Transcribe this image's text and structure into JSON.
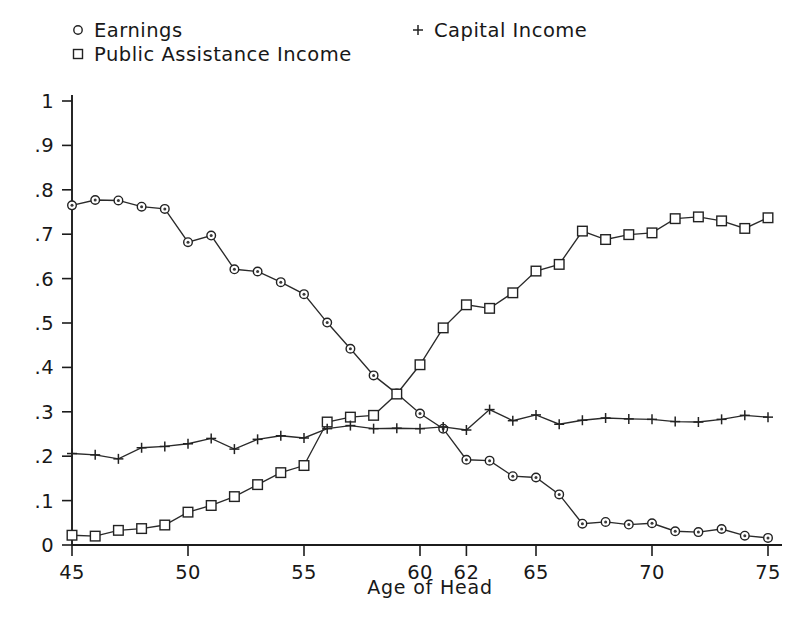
{
  "chart_data": {
    "type": "line",
    "title": "",
    "xlabel": "Age of Head",
    "ylabel": "",
    "xlim": [
      45,
      75
    ],
    "ylim": [
      0,
      1
    ],
    "grid": false,
    "legend_position": "top",
    "xticks": [
      45,
      50,
      55,
      60,
      62,
      65,
      70,
      75
    ],
    "xtick_labels": [
      "45",
      "50",
      "55",
      "60",
      "62",
      "65",
      "70",
      "75"
    ],
    "yticks": [
      0,
      0.1,
      0.2,
      0.3,
      0.4,
      0.5,
      0.6,
      0.7,
      0.8,
      0.9,
      1
    ],
    "ytick_labels": [
      "0",
      ".1",
      ".2",
      ".3",
      ".4",
      ".5",
      ".6",
      ".7",
      ".8",
      ".9",
      "1"
    ],
    "x": [
      45,
      46,
      47,
      48,
      49,
      50,
      51,
      52,
      53,
      54,
      55,
      56,
      57,
      58,
      59,
      60,
      61,
      62,
      63,
      64,
      65,
      66,
      67,
      68,
      69,
      70,
      71,
      72,
      73,
      74,
      75
    ],
    "series": [
      {
        "name": "Earnings",
        "marker": "circle",
        "values": [
          0.765,
          0.777,
          0.776,
          0.762,
          0.757,
          0.682,
          0.697,
          0.621,
          0.616,
          0.592,
          0.565,
          0.501,
          0.442,
          0.382,
          0.341,
          0.296,
          0.262,
          0.192,
          0.19,
          0.155,
          0.152,
          0.114,
          0.048,
          0.052,
          0.046,
          0.049,
          0.031,
          0.029,
          0.036,
          0.021,
          0.016
        ]
      },
      {
        "name": "Public Assistance Income",
        "marker": "square",
        "values": [
          0.022,
          0.02,
          0.033,
          0.037,
          0.045,
          0.074,
          0.089,
          0.109,
          0.136,
          0.163,
          0.179,
          0.277,
          0.288,
          0.292,
          0.34,
          0.406,
          0.489,
          0.541,
          0.533,
          0.568,
          0.617,
          0.632,
          0.707,
          0.688,
          0.699,
          0.703,
          0.735,
          0.739,
          0.73,
          0.713,
          0.737
        ]
      },
      {
        "name": "Capital Income",
        "marker": "plus",
        "values": [
          0.206,
          0.203,
          0.194,
          0.219,
          0.222,
          0.228,
          0.24,
          0.216,
          0.238,
          0.246,
          0.241,
          0.262,
          0.269,
          0.262,
          0.263,
          0.262,
          0.266,
          0.259,
          0.305,
          0.28,
          0.293,
          0.272,
          0.281,
          0.286,
          0.284,
          0.283,
          0.278,
          0.277,
          0.283,
          0.292,
          0.288
        ]
      }
    ]
  },
  "legend": {
    "items": [
      {
        "label": "Earnings",
        "marker": "circle"
      },
      {
        "label": "Public Assistance Income",
        "marker": "square"
      },
      {
        "label": "Capital Income",
        "marker": "plus"
      }
    ]
  },
  "colors": {
    "ink": "#1c1c1c",
    "background": "#ffffff",
    "marker_fill": "#ffffff"
  }
}
